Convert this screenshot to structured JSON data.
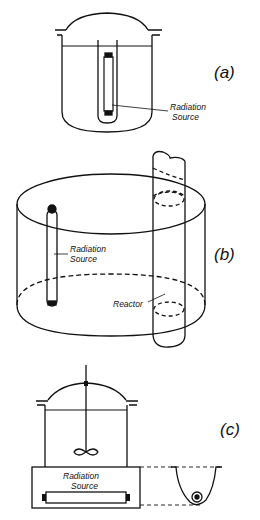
{
  "panels": {
    "a": {
      "tag": "(a)",
      "label_line1": "Radiation",
      "label_line2": "Source"
    },
    "b": {
      "tag": "(b)",
      "label_line1": "Radiation",
      "label_line2": "Source",
      "reactor_label": "Reactor"
    },
    "c": {
      "tag": "(c)",
      "label_line1": "Radiation",
      "label_line2": "Source"
    }
  },
  "colors": {
    "stroke": "#111111",
    "background": "#ffffff"
  }
}
